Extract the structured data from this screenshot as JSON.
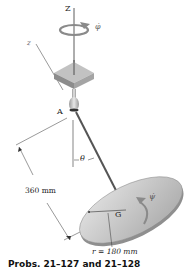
{
  "figure": {
    "labels": {
      "z_axis_upper": "Z",
      "z_axis_lower": "z",
      "phi_dot": "φ̇",
      "point_a": "A",
      "theta": "θ",
      "length": "360 mm",
      "center_g": "G",
      "psi_dot": "ψ̇",
      "radius": "r = 180 mm"
    },
    "caption": "Probs. 21–127 and 21–128",
    "colors": {
      "line": "#333333",
      "disk_top": "#c9c9c9",
      "disk_edge": "#9a9a9a",
      "block_top": "#b5b5b5",
      "block_side": "#8c8c8c",
      "arrow_gray": "#8a8a8a"
    }
  }
}
